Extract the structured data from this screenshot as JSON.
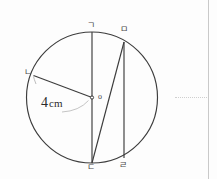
{
  "figure": {
    "canvas": {
      "width": 217,
      "height": 179
    },
    "stroke_color": "#3c3c3c",
    "guide_color": "#b0b0b0",
    "margin_rule_color": "#c9c9c9",
    "circle": {
      "cx": 92,
      "cy": 97.5,
      "r": 65.5
    },
    "center_dot": {
      "cx": 92,
      "cy": 97.5,
      "r": 1.6
    },
    "labels": {
      "top": "ㄱ",
      "upper_right": "ㅁ",
      "left": "ㄴ",
      "bottom": "ㄷ",
      "bottom_right": "ㄹ",
      "center": "o",
      "measure_value": "4",
      "measure_unit": "cm"
    },
    "label_positions": {
      "top": {
        "x": 87,
        "y": 21
      },
      "upper_right": {
        "x": 120,
        "y": 25
      },
      "left": {
        "x": 24,
        "y": 68
      },
      "bottom": {
        "x": 87,
        "y": 163
      },
      "bottom_right": {
        "x": 119,
        "y": 161
      },
      "center": {
        "x": 98,
        "y": 93
      },
      "measure": {
        "x": 41,
        "y": 96
      }
    },
    "segments": [
      {
        "name": "diameter-gieuk-digeut",
        "x1": 92,
        "y1": 32,
        "x2": 92,
        "y2": 163
      },
      {
        "name": "radius-nieun-center",
        "x1": 33.5,
        "y1": 75.5,
        "x2": 92,
        "y2": 97.5
      },
      {
        "name": "chord-mieum-digeut",
        "x1": 124,
        "y1": 42,
        "x2": 92,
        "y2": 163
      },
      {
        "name": "chord-mieum-rieul",
        "x1": 124,
        "y1": 42,
        "x2": 124,
        "y2": 158
      }
    ],
    "guide_arcs": [
      {
        "name": "angle-arc-at-nieun",
        "d": "M 36 84 Q 34 79 33.5 76.5"
      },
      {
        "name": "angle-arc-at-center",
        "d": "M 62 111 Q 78 110 88 100"
      }
    ],
    "page_margin_rule": {
      "x": 208
    },
    "leader_dots": {
      "x": 175,
      "y": 97,
      "width": 32
    }
  }
}
